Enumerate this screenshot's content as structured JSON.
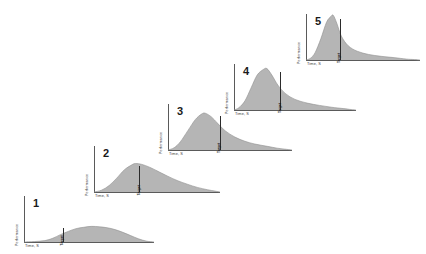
{
  "figure": {
    "background_color": "#ffffff",
    "curve_fill_color": "#a8a8a8",
    "axis_color": "#5a5a5a",
    "target_marker_color": "#2b2b2b"
  },
  "chart_data": {
    "type": "area",
    "title": "",
    "xlabel": "Time, S",
    "ylabel": "Performance",
    "grid": false,
    "legend": false,
    "panel_count": 5,
    "panels": [
      {
        "number": "1",
        "xlabel": "Time, S",
        "ylabel": "Performance",
        "target_label": "Target",
        "target_x_frac": 0.3,
        "peak_height_frac": 0.34,
        "peak_x_frac": 0.52,
        "x": [
          0.0,
          0.08,
          0.16,
          0.22,
          0.28,
          0.34,
          0.4,
          0.46,
          0.52,
          0.58,
          0.64,
          0.7,
          0.76,
          0.82,
          0.88,
          0.94,
          1.0
        ],
        "y": [
          0.0,
          0.01,
          0.03,
          0.08,
          0.16,
          0.23,
          0.29,
          0.32,
          0.34,
          0.33,
          0.31,
          0.27,
          0.21,
          0.14,
          0.07,
          0.02,
          0.0
        ]
      },
      {
        "number": "2",
        "xlabel": "Time, S",
        "ylabel": "Performance",
        "target_label": "Target",
        "target_x_frac": 0.36,
        "peak_height_frac": 0.62,
        "peak_x_frac": 0.33,
        "x": [
          0.0,
          0.06,
          0.12,
          0.18,
          0.24,
          0.3,
          0.33,
          0.38,
          0.44,
          0.5,
          0.58,
          0.66,
          0.74,
          0.82,
          0.9,
          0.96,
          1.0
        ],
        "y": [
          0.0,
          0.04,
          0.14,
          0.3,
          0.48,
          0.59,
          0.62,
          0.6,
          0.54,
          0.46,
          0.35,
          0.25,
          0.17,
          0.1,
          0.05,
          0.02,
          0.0
        ]
      },
      {
        "number": "3",
        "xlabel": "Time, S",
        "ylabel": "Performance",
        "target_label": "Target",
        "target_x_frac": 0.42,
        "peak_height_frac": 0.8,
        "peak_x_frac": 0.3,
        "x": [
          0.0,
          0.05,
          0.1,
          0.16,
          0.22,
          0.27,
          0.3,
          0.35,
          0.4,
          0.46,
          0.54,
          0.62,
          0.7,
          0.8,
          0.88,
          0.94,
          1.0
        ],
        "y": [
          0.0,
          0.05,
          0.18,
          0.42,
          0.66,
          0.78,
          0.8,
          0.72,
          0.58,
          0.42,
          0.28,
          0.19,
          0.13,
          0.08,
          0.04,
          0.02,
          0.0
        ]
      },
      {
        "number": "4",
        "xlabel": "Time, S",
        "ylabel": "Performance",
        "target_label": "Target",
        "target_x_frac": 0.38,
        "peak_height_frac": 0.9,
        "peak_x_frac": 0.27,
        "x": [
          0.0,
          0.04,
          0.09,
          0.14,
          0.19,
          0.24,
          0.27,
          0.31,
          0.36,
          0.42,
          0.5,
          0.6,
          0.7,
          0.8,
          0.9,
          0.96,
          1.0
        ],
        "y": [
          0.0,
          0.05,
          0.2,
          0.48,
          0.76,
          0.88,
          0.9,
          0.76,
          0.54,
          0.36,
          0.23,
          0.15,
          0.1,
          0.06,
          0.03,
          0.01,
          0.0
        ]
      },
      {
        "number": "5",
        "xlabel": "Time, S",
        "ylabel": "Performance",
        "target_label": "Target",
        "target_x_frac": 0.3,
        "peak_height_frac": 0.97,
        "peak_x_frac": 0.24,
        "x": [
          0.0,
          0.04,
          0.08,
          0.13,
          0.18,
          0.22,
          0.24,
          0.27,
          0.31,
          0.37,
          0.45,
          0.55,
          0.66,
          0.78,
          0.88,
          0.95,
          1.0
        ],
        "y": [
          0.0,
          0.04,
          0.16,
          0.46,
          0.82,
          0.95,
          0.97,
          0.8,
          0.52,
          0.31,
          0.19,
          0.12,
          0.08,
          0.05,
          0.02,
          0.01,
          0.0
        ]
      }
    ]
  },
  "panel_geometry": [
    {
      "left": 24,
      "top": 196,
      "width": 130,
      "height": 46
    },
    {
      "left": 94,
      "top": 146,
      "width": 126,
      "height": 46
    },
    {
      "left": 168,
      "top": 104,
      "width": 124,
      "height": 46
    },
    {
      "left": 234,
      "top": 64,
      "width": 122,
      "height": 46
    },
    {
      "left": 306,
      "top": 14,
      "width": 114,
      "height": 46
    }
  ]
}
